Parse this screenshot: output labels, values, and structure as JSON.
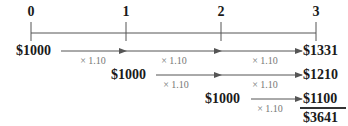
{
  "timeline": {
    "periods": [
      "0",
      "1",
      "2",
      "3"
    ],
    "period_x": [
      31,
      126,
      221,
      316
    ]
  },
  "rows": [
    {
      "start_label": "$1000",
      "end_label": "$1331",
      "multipliers": [
        "× 1.10",
        "× 1.10",
        "× 1.10"
      ]
    },
    {
      "start_label": "$1000",
      "end_label": "$1210",
      "multipliers": [
        "× 1.10",
        "× 1.10"
      ]
    },
    {
      "start_label": "$1000",
      "end_label": "$1100",
      "multipliers": [
        "× 1.10"
      ]
    }
  ],
  "total": "$3641",
  "colors": {
    "line": "#555555",
    "text": "#1a1a1a",
    "multiplier": "#777777"
  }
}
